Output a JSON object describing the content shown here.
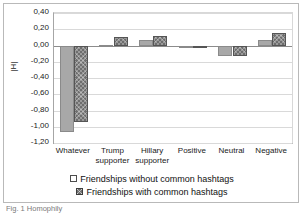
{
  "chart_data": {
    "type": "bar",
    "title": "",
    "subtitle": "",
    "xlabel": "",
    "ylabel": "|H|",
    "categories": [
      "Whatever",
      "Trump supporter",
      "Hillary supporter",
      "Positive",
      "Neutral",
      "Negative"
    ],
    "category_lines": [
      [
        "Whatever"
      ],
      [
        "Trump",
        "supporter"
      ],
      [
        "Hillary",
        "supporter"
      ],
      [
        "Positive"
      ],
      [
        "Neutral"
      ],
      [
        "Negative"
      ]
    ],
    "series": [
      {
        "name": "Friendships without common hashtags",
        "values": [
          -1.06,
          0.01,
          0.07,
          -0.01,
          -0.13,
          0.07
        ]
      },
      {
        "name": "Friendships with common hashtags",
        "values": [
          -0.94,
          0.1,
          0.12,
          -0.01,
          -0.13,
          0.15
        ]
      }
    ],
    "ylim": [
      -1.2,
      0.4
    ],
    "yticks": [
      0.4,
      0.2,
      0.0,
      -0.2,
      -0.4,
      -0.6,
      -0.8,
      -1.0,
      -1.2
    ],
    "ytick_labels": [
      "0,40",
      "0,20",
      "0,00",
      "-0,20",
      "-0,40",
      "-0,60",
      "-0,80",
      "-1,00",
      "-1,20"
    ],
    "grid": true,
    "legend_position": "bottom",
    "colors": {
      "series0_fill": "#a8a8a8",
      "series0_border": "#8a8a8a",
      "series1_fill": "#6e6e6e",
      "series1_border": "#555555",
      "gridline": "#d9d9d9",
      "axis": "#8c8c8c",
      "text": "#1a1a1a",
      "frame": "#b9b9b9"
    }
  },
  "legend": {
    "items": [
      {
        "label": "Friendships without common hashtags",
        "swatch": "empty-square"
      },
      {
        "label": "Friendships with common hashtags",
        "swatch": "hatched-square"
      }
    ]
  },
  "caption": {
    "text": "Fig. 1 Homophily"
  }
}
